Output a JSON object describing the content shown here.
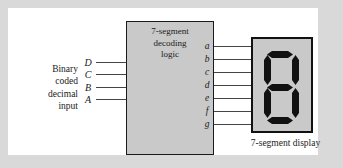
{
  "figure": {
    "type": "block-diagram",
    "caption_display": "7-segment display"
  },
  "decoder": {
    "title_lines": [
      "7-segment",
      "decoding",
      "logic"
    ]
  },
  "inputs": {
    "description_lines": [
      "Binary",
      "coded",
      "decimal",
      "input"
    ],
    "signals": [
      {
        "label": "D"
      },
      {
        "label": "C"
      },
      {
        "label": "B"
      },
      {
        "label": "A"
      }
    ]
  },
  "outputs": {
    "signals": [
      {
        "label": "a"
      },
      {
        "label": "b"
      },
      {
        "label": "c"
      },
      {
        "label": "d"
      },
      {
        "label": "e"
      },
      {
        "label": "f"
      },
      {
        "label": "g"
      }
    ]
  },
  "display": {
    "segments_lit": [
      "a",
      "b",
      "c",
      "d",
      "e",
      "f",
      "g"
    ],
    "digit_shown": "8"
  },
  "colors": {
    "page_margin": "#d9d9d9",
    "canvas": "#ffffff",
    "block_fill": "#c9c9c9",
    "outline": "#1a1a1a",
    "segment_on": "#111111",
    "wire": "#444444"
  }
}
